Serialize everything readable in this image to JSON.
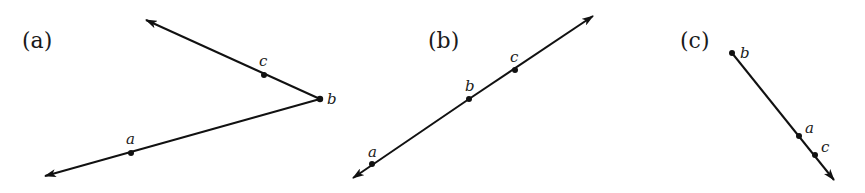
{
  "panels": [
    {
      "label": "(a)",
      "description": "Two rays from b: one through c, one through a (an angle)",
      "points": [
        {
          "name": "a",
          "x": 131,
          "y": 153
        },
        {
          "name": "b",
          "x": 320,
          "y": 99
        },
        {
          "name": "c",
          "x": 264,
          "y": 75
        }
      ],
      "rays": [
        {
          "from": "b",
          "through": "c",
          "tip": {
            "x": 146,
            "y": 20
          }
        },
        {
          "from": "b",
          "through": "a",
          "tip": {
            "x": 45,
            "y": 176
          }
        }
      ]
    },
    {
      "label": "(b)",
      "description": "Line through a, b, c with arrows at both ends",
      "points": [
        {
          "name": "a",
          "x": 372,
          "y": 164
        },
        {
          "name": "b",
          "x": 469,
          "y": 99
        },
        {
          "name": "c",
          "x": 515,
          "y": 70
        }
      ],
      "line": {
        "tip1": {
          "x": 353,
          "y": 178
        },
        "tip2": {
          "x": 593,
          "y": 16
        }
      }
    },
    {
      "label": "(c)",
      "description": "Ray from b through a and c",
      "points": [
        {
          "name": "b",
          "x": 732,
          "y": 53
        },
        {
          "name": "a",
          "x": 799,
          "y": 136
        },
        {
          "name": "c",
          "x": 815,
          "y": 155
        }
      ],
      "ray": {
        "from": "b",
        "tip": {
          "x": 834,
          "y": 180
        }
      }
    }
  ]
}
